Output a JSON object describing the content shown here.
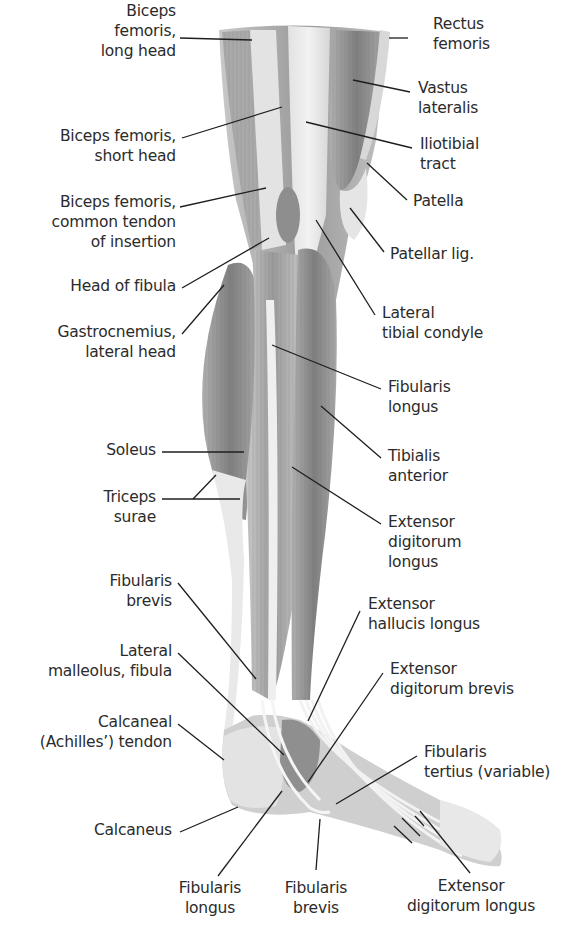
{
  "diagram": {
    "labels": {
      "biceps_long_head": "Biceps\nfemoris,\nlong head",
      "biceps_short_head": "Biceps femoris,\nshort head",
      "biceps_common_tendon": "Biceps femoris,\ncommon tendon\nof insertion",
      "head_of_fibula": "Head of fibula",
      "gastrocnemius_lateral": "Gastrocnemius,\nlateral head",
      "soleus": "Soleus",
      "triceps_surae": "Triceps\nsurae",
      "fibularis_brevis_left": "Fibularis\nbrevis",
      "lateral_malleolus": "Lateral\nmalleolus, fibula",
      "calcaneal_tendon": "Calcaneal\n(Achilles’) tendon",
      "calcaneus": "Calcaneus",
      "fibularis_longus_bottom": "Fibularis\nlongus",
      "fibularis_brevis_bottom": "Fibularis\nbrevis",
      "extensor_digitorum_longus_bottom": "Extensor\ndigitorum longus",
      "rectus_femoris": "Rectus\nfemoris",
      "vastus_lateralis": "Vastus\nlateralis",
      "iliotibial_tract": "Iliotibial\ntract",
      "patella": "Patella",
      "patellar_lig": "Patellar lig.",
      "lateral_tibial_condyle": "Lateral\ntibial condyle",
      "fibularis_longus_right": "Fibularis\nlongus",
      "tibialis_anterior": "Tibialis\nanterior",
      "extensor_digitorum_longus_right": "Extensor\ndigitorum\nlongus",
      "extensor_hallucis_longus": "Extensor\nhallucis longus",
      "extensor_digitorum_brevis": "Extensor\ndigitorum brevis",
      "fibularis_tertius": "Fibularis\ntertius (variable)"
    },
    "colors": {
      "background": "#ffffff",
      "text": "#2b2b2b",
      "leader_line": "#1e1e1e",
      "muscle_dark": "#8d8d8d",
      "muscle_mid": "#b3b3b3",
      "tendon_light": "#e6e6e6"
    }
  }
}
